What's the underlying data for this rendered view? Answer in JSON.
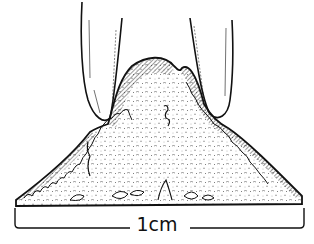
{
  "figure": {
    "type": "line-illustration",
    "colors": {
      "ink": "#111111",
      "background": "#ffffff",
      "hatch": "#222222"
    }
  },
  "scale_bar": {
    "label": "1cm",
    "x_start": 14,
    "x_end": 305,
    "y": 228
  },
  "elements": {
    "left_tool": "instrument-tip-left",
    "right_tool": "instrument-tip-right",
    "mound": "tissue-mound-cross-section"
  }
}
